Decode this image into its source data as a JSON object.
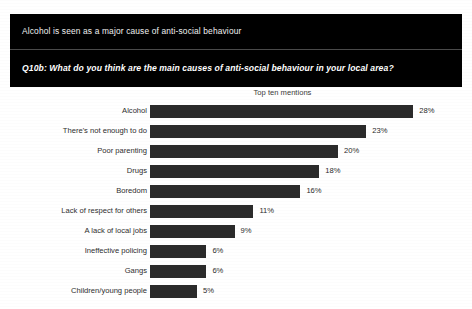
{
  "header": {
    "title": "Alcohol is seen as a major cause of anti-social behaviour",
    "question": "Q10b: What do you think are the main causes of anti-social behaviour in your local area?"
  },
  "chart_data": {
    "type": "bar",
    "orientation": "horizontal",
    "title": "Top ten mentions",
    "subtitle": "Top ten mentions",
    "xlabel": "",
    "ylabel": "",
    "xlim": [
      0,
      30
    ],
    "grid": false,
    "legend": false,
    "value_suffix": "%",
    "categories": [
      "Alcohol",
      "There's not enough to do",
      "Poor parenting",
      "Drugs",
      "Boredom",
      "Lack of respect for others",
      "A lack of local jobs",
      "Ineffective policing",
      "Gangs",
      "Children/young people"
    ],
    "values": [
      28,
      23,
      20,
      18,
      16,
      11,
      9,
      6,
      6,
      5
    ],
    "value_labels": [
      "28%",
      "23%",
      "20%",
      "18%",
      "16%",
      "11%",
      "9%",
      "6%",
      "6%",
      "5%"
    ],
    "series": [
      {
        "name": "Top ten mentions",
        "values": [
          28,
          23,
          20,
          18,
          16,
          11,
          9,
          6,
          6,
          5
        ]
      }
    ]
  },
  "colors": {
    "bar": "#2b2b2b",
    "banner_background": "#000000",
    "banner_text": "#ffffff",
    "page_background": "#ffffff",
    "label_text": "#2e2e2e"
  }
}
